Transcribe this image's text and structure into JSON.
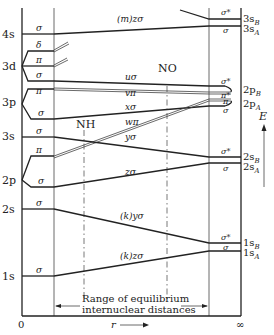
{
  "diagram": {
    "axis": {
      "x_label": "r",
      "x_start": "0",
      "x_end": "∞",
      "y_label": "E"
    },
    "range_label_line1": "Range of equilibrium",
    "range_label_line2": "internuclear distances",
    "molecule_markers": [
      "NH",
      "NO"
    ],
    "united_atom_levels": [
      "4s",
      "3d",
      "3p",
      "3s",
      "2p",
      "2s",
      "1s"
    ],
    "separated_atom_levels": [
      "3s_B",
      "3s_A",
      "2p_B",
      "2p_A",
      "2s_B",
      "2s_A",
      "1s_B",
      "1s_A"
    ],
    "left_symmetry_labels": [
      "σ",
      "δ",
      "π",
      "σ",
      "π",
      "σ",
      "σ",
      "π",
      "σ",
      "σ",
      "σ"
    ],
    "right_symmetry_labels": [
      "σ*",
      "σ",
      "σ*",
      "π*",
      "π",
      "σ",
      "σ*",
      "σ",
      "σ*",
      "σ"
    ],
    "orbital_labels": [
      "(m)zσ",
      "uσ",
      "vπ",
      "xσ",
      "wπ",
      "yσ",
      "zσ",
      "(k)yσ",
      "(k)zσ"
    ]
  }
}
